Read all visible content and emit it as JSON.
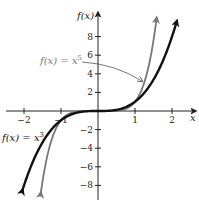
{
  "chart_data": {
    "type": "line",
    "title": "",
    "xlabel": "x",
    "ylabel": "f(x)",
    "xlim": [
      -2.5,
      2.5
    ],
    "ylim": [
      -9,
      9.5
    ],
    "xticks": [
      -2,
      -1,
      1,
      2
    ],
    "xtick_labels": [
      "−2",
      "−1",
      "1",
      "2"
    ],
    "yticks": [
      -8,
      -6,
      -4,
      -2,
      2,
      4,
      6,
      8
    ],
    "ytick_labels": [
      "−8",
      "−6",
      "−4",
      "−2",
      "2",
      "4",
      "6",
      "8"
    ],
    "grid": false,
    "series": [
      {
        "name": "f(x) = x^3",
        "label_text": "f(x) = x",
        "label_exp": "3",
        "exponent": 3,
        "color": "#111111",
        "x_range": [
          -2.05,
          2.12
        ],
        "x": [
          -2,
          -1.5,
          -1,
          -0.5,
          0,
          0.5,
          1,
          1.5,
          2
        ],
        "y": [
          -8,
          -3.375,
          -1,
          -0.125,
          0,
          0.125,
          1,
          3.375,
          8
        ]
      },
      {
        "name": "f(x) = x^5",
        "label_text": "f(x) = x",
        "label_exp": "5",
        "exponent": 5,
        "color": "#777777",
        "x_range": [
          -1.55,
          1.58
        ],
        "x": [
          -1.5,
          -1,
          -0.5,
          0,
          0.5,
          1,
          1.5
        ],
        "y": [
          -7.59,
          -1,
          -0.031,
          0,
          0.031,
          1,
          7.59
        ]
      }
    ],
    "annotations": [
      {
        "text": "f(x) = x",
        "exp": "5",
        "arrow_to": [
          1.25,
          3.2
        ],
        "color": "#777777"
      }
    ]
  }
}
